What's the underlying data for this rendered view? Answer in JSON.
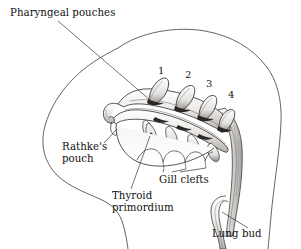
{
  "figure": {
    "title": "Pharyngeal pouches",
    "colors": {
      "ink": "#1a1a1a",
      "outline": "#3a3a3a",
      "shade_light": "#e8e6e4",
      "shade_mid": "#b9b6b3",
      "shade_dark": "#4a4744",
      "background": "#ffffff"
    },
    "labels": [
      {
        "id": "pharyngeal-pouches",
        "text": "Pharyngeal pouches",
        "x": 10,
        "y": 9,
        "lines": [
          "Pharyngeal pouches"
        ]
      },
      {
        "id": "rathkes-pouch",
        "text": "Rathke's pouch",
        "x": 62,
        "y": 143,
        "lines": [
          "Rathke's",
          "pouch"
        ]
      },
      {
        "id": "thyroid-primordium",
        "text": "Thyroid primordium",
        "x": 112,
        "y": 192,
        "lines": [
          "Thyroid",
          "primordium"
        ]
      },
      {
        "id": "gill-clefts",
        "text": "Gill clefts",
        "x": 160,
        "y": 175,
        "lines": [
          "Gill clefts"
        ]
      },
      {
        "id": "lung-bud",
        "text": "Lung bud",
        "x": 212,
        "y": 229,
        "lines": [
          "Lung bud"
        ]
      }
    ],
    "pouch_numbers": [
      {
        "id": "pouch-1",
        "label": "1",
        "x": 158,
        "y": 68
      },
      {
        "id": "pouch-2",
        "label": "2",
        "x": 185,
        "y": 71
      },
      {
        "id": "pouch-3",
        "label": "3",
        "x": 206,
        "y": 80
      },
      {
        "id": "pouch-4",
        "label": "4",
        "x": 228,
        "y": 91
      }
    ],
    "structures": [
      {
        "id": "embryo-body-outline",
        "name": "embryo body outline"
      },
      {
        "id": "pharynx-tube",
        "name": "pharynx"
      },
      {
        "id": "pharyngeal-pouch-1",
        "name": "pharyngeal pouch 1"
      },
      {
        "id": "pharyngeal-pouch-2",
        "name": "pharyngeal pouch 2"
      },
      {
        "id": "pharyngeal-pouch-3",
        "name": "pharyngeal pouch 3"
      },
      {
        "id": "pharyngeal-pouch-4",
        "name": "pharyngeal pouch 4"
      },
      {
        "id": "rathkes-pouch-structure",
        "name": "Rathke's pouch"
      },
      {
        "id": "thyroid-primordium-structure",
        "name": "thyroid primordium"
      },
      {
        "id": "gill-clefts-structure",
        "name": "gill clefts"
      },
      {
        "id": "foregut-tube",
        "name": "foregut / esophagus"
      },
      {
        "id": "lung-bud-structure",
        "name": "lung bud"
      }
    ]
  }
}
